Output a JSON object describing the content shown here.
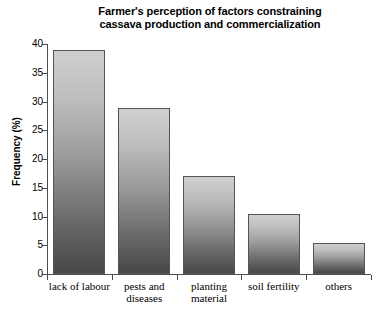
{
  "chart_data": {
    "type": "bar",
    "title": "Farmer's perception of factors constraining\ncassava production and commercialization",
    "xlabel": "",
    "ylabel": "Frequency (%)",
    "categories": [
      "lack of labour",
      "pests and\ndiseases",
      "planting\nmaterial",
      "soil fertility",
      "others"
    ],
    "values": [
      39.0,
      28.8,
      17.1,
      10.5,
      5.4
    ],
    "ylim": [
      0,
      40
    ],
    "yticks": [
      0,
      5,
      10,
      15,
      20,
      25,
      30,
      35,
      40
    ],
    "ytick_labels": [
      "0",
      "5",
      "10",
      "15",
      "20",
      "25",
      "30",
      "35",
      "40"
    ],
    "grid": false,
    "legend": null,
    "bar_fill_top_color": "#cfcfcf",
    "bar_fill_bottom_color": "#474747",
    "bar_edge_color": "#555555",
    "axis_color": "#4d4d4d",
    "background_color": "#ffffff"
  }
}
